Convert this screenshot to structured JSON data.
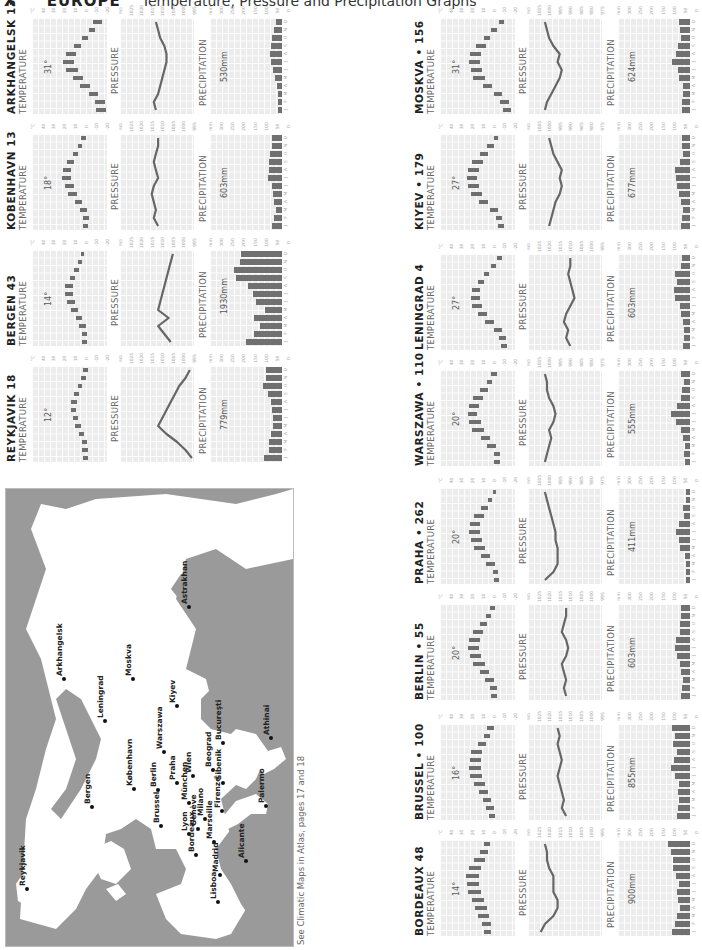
{
  "header": {
    "section": "X",
    "region": "EUROPE",
    "subtitle": "Temperature, Pressure and Precipitation Graphs"
  },
  "labels": {
    "temperature": "TEMPERATURE",
    "pressure": "PRESSURE",
    "precipitation": "PRECIPITATION",
    "months": [
      "J",
      "F",
      "M",
      "A",
      "M",
      "J",
      "J",
      "A",
      "S",
      "O",
      "N",
      "D"
    ],
    "temp_ticks": [
      "°C",
      "40",
      "30",
      "20",
      "10",
      "0",
      "-10",
      "-20"
    ],
    "precip_ticks": [
      "mm",
      "300",
      "250",
      "200",
      "150",
      "100",
      "50",
      "0"
    ]
  },
  "caption": "See Climatic Maps in Atlas, pages 17 and 18",
  "colors": {
    "bar": "#6e6e6e",
    "grid_bg": "#ececec",
    "land": "#9a9a9a",
    "sea": "#ffffff"
  },
  "chart_data": [
    {
      "type": "bar",
      "city": "ARKHANGELSK",
      "elev": "13",
      "sep": "",
      "temp_range_label": "31°",
      "precip_total": "530mm",
      "pressure_ticks": [
        "mb",
        "1025",
        "1020",
        "1015",
        "1010",
        "1005",
        "1000",
        "995"
      ],
      "temp_min": [
        -19,
        -18,
        -12,
        -4,
        2,
        7,
        11,
        9,
        4,
        -2,
        -9,
        -15
      ],
      "temp_max": [
        -10,
        -9,
        -3,
        5,
        12,
        18,
        21,
        18,
        11,
        3,
        -3,
        -7
      ],
      "pressure": [
        1013,
        1014,
        1012,
        1011,
        1010,
        1009,
        1008,
        1008,
        1009,
        1011,
        1012,
        1013
      ],
      "precip": [
        22,
        20,
        22,
        25,
        34,
        45,
        54,
        58,
        56,
        50,
        38,
        30
      ]
    },
    {
      "type": "bar",
      "city": "KOBENHAVN",
      "elev": "13",
      "sep": "",
      "temp_range_label": "18°",
      "precip_total": "603mm",
      "pressure_ticks": [
        "mb",
        "1025",
        "1020",
        "1015",
        "1010",
        "1005",
        "1000",
        "995"
      ],
      "temp_min": [
        -2,
        -3,
        -1,
        3,
        8,
        11,
        14,
        14,
        11,
        7,
        3,
        0
      ],
      "temp_max": [
        2,
        2,
        5,
        10,
        16,
        19,
        22,
        21,
        17,
        12,
        7,
        4
      ],
      "pressure": [
        1012,
        1014,
        1013,
        1014,
        1015,
        1014,
        1012,
        1013,
        1014,
        1013,
        1012,
        1012
      ],
      "precip": [
        49,
        39,
        32,
        38,
        43,
        47,
        71,
        66,
        62,
        59,
        48,
        49
      ]
    },
    {
      "type": "bar",
      "city": "BERGEN",
      "elev": "43",
      "sep": "",
      "temp_range_label": "14°",
      "precip_total": "1930mm",
      "pressure_ticks": [
        "mb",
        "1025",
        "1020",
        "1015",
        "1010",
        "1005",
        "1000",
        "995"
      ],
      "temp_min": [
        -1,
        -1,
        0,
        3,
        7,
        10,
        12,
        12,
        10,
        6,
        3,
        1
      ],
      "temp_max": [
        3,
        3,
        6,
        9,
        14,
        17,
        19,
        19,
        15,
        11,
        7,
        4
      ],
      "pressure": [
        1006,
        1009,
        1012,
        1007,
        1012,
        1011,
        1010,
        1009,
        1008,
        1007,
        1006,
        1005
      ],
      "precip": [
        179,
        139,
        109,
        140,
        83,
        126,
        141,
        167,
        228,
        236,
        207,
        203
      ]
    },
    {
      "type": "bar",
      "city": "REYKJAVIK",
      "elev": "18",
      "sep": "",
      "temp_range_label": "12°",
      "precip_total": "779mm",
      "pressure_ticks": [
        "mb",
        "1025",
        "1020",
        "1015",
        "1010",
        "1005",
        "1000",
        "995"
      ],
      "temp_min": [
        -2,
        -2,
        -1,
        1,
        4,
        7,
        9,
        8,
        6,
        3,
        0,
        -2
      ],
      "temp_max": [
        2,
        3,
        3,
        6,
        10,
        12,
        14,
        14,
        11,
        7,
        4,
        2
      ],
      "pressure": [
        996,
        999,
        1003,
        1008,
        1012,
        1010,
        1008,
        1006,
        1004,
        1002,
        999,
        997
      ],
      "precip": [
        89,
        64,
        62,
        56,
        42,
        42,
        50,
        56,
        67,
        94,
        78,
        79
      ]
    },
    {
      "type": "bar",
      "city": "MOSKVA",
      "elev": "156",
      "sep": "•",
      "temp_range_label": "31°",
      "precip_total": "624mm",
      "pressure_ticks": [
        "mb",
        "1005",
        "1000",
        "995",
        "990",
        "985",
        "980",
        "975"
      ],
      "temp_min": [
        -16,
        -14,
        -8,
        1,
        8,
        11,
        13,
        12,
        7,
        3,
        -3,
        -10
      ],
      "temp_max": [
        -9,
        -6,
        0,
        10,
        19,
        21,
        23,
        22,
        16,
        9,
        2,
        -5
      ],
      "pressure": [
        1002,
        1001,
        999,
        997,
        995,
        994,
        996,
        995,
        998,
        1000,
        1001,
        1002
      ],
      "precip": [
        39,
        38,
        36,
        37,
        53,
        58,
        88,
        71,
        58,
        45,
        47,
        54
      ]
    },
    {
      "type": "bar",
      "city": "KIYEV",
      "elev": "179",
      "sep": "•",
      "temp_range_label": "27°",
      "precip_total": "677mm",
      "pressure_ticks": [
        "mb",
        "1005",
        "1000",
        "995",
        "990",
        "985",
        "980",
        "975"
      ],
      "temp_min": [
        -10,
        -8,
        -4,
        5,
        11,
        14,
        15,
        14,
        10,
        5,
        0,
        -4
      ],
      "temp_max": [
        -4,
        -2,
        3,
        14,
        21,
        24,
        25,
        24,
        20,
        13,
        6,
        0
      ],
      "pressure": [
        1000,
        999,
        998,
        997,
        995,
        994,
        995,
        994,
        996,
        998,
        999,
        1000
      ],
      "precip": [
        43,
        39,
        35,
        46,
        56,
        66,
        70,
        72,
        47,
        35,
        41,
        41
      ]
    },
    {
      "type": "bar",
      "city": "LENINGRAD",
      "elev": "4",
      "sep": "",
      "temp_range_label": "27°",
      "precip_total": "603mm",
      "pressure_ticks": [
        "mb",
        "1025",
        "1020",
        "1015",
        "1010",
        "1005",
        "1000",
        "995"
      ],
      "temp_min": [
        -13,
        -12,
        -8,
        0,
        6,
        11,
        13,
        13,
        9,
        4,
        -2,
        -8
      ],
      "temp_max": [
        -7,
        -5,
        0,
        8,
        15,
        20,
        21,
        20,
        15,
        9,
        2,
        -3
      ],
      "pressure": [
        1010,
        1012,
        1011,
        1013,
        1012,
        1010,
        1008,
        1009,
        1010,
        1011,
        1010,
        1010
      ],
      "precip": [
        35,
        30,
        31,
        36,
        45,
        50,
        72,
        78,
        64,
        76,
        46,
        40
      ]
    },
    {
      "type": "bar",
      "city": "WARSZAWA",
      "elev": "110",
      "sep": "•",
      "temp_range_label": "20°",
      "precip_total": "555mm",
      "pressure_ticks": [
        "mb",
        "1005",
        "1000",
        "995",
        "990",
        "985",
        "980",
        "975"
      ],
      "temp_min": [
        -6,
        -6,
        -2,
        3,
        9,
        12,
        15,
        14,
        10,
        5,
        1,
        -3
      ],
      "temp_max": [
        0,
        0,
        6,
        12,
        20,
        23,
        24,
        23,
        19,
        13,
        6,
        2
      ],
      "pressure": [
        1002,
        1001,
        1000,
        999,
        1000,
        998,
        997,
        998,
        1000,
        1001,
        1001,
        1002
      ],
      "precip": [
        27,
        32,
        27,
        37,
        46,
        69,
        96,
        65,
        43,
        38,
        31,
        44
      ]
    },
    {
      "type": "bar",
      "city": "PRAHA",
      "elev": "262",
      "sep": "•",
      "temp_range_label": "20°",
      "precip_total": "411mm",
      "pressure_ticks": [
        "mb",
        "1005",
        "1000",
        "995",
        "990",
        "985",
        "980",
        "975"
      ],
      "temp_min": [
        -5,
        -4,
        -1,
        3,
        8,
        11,
        13,
        13,
        9,
        5,
        1,
        -2
      ],
      "temp_max": [
        0,
        1,
        7,
        12,
        18,
        21,
        23,
        22,
        18,
        12,
        5,
        1
      ],
      "pressure": [
        1002,
        998,
        996,
        996,
        996,
        997,
        997,
        998,
        999,
        1000,
        1001,
        1002
      ],
      "precip": [
        18,
        18,
        18,
        27,
        48,
        54,
        68,
        55,
        31,
        33,
        20,
        21
      ]
    },
    {
      "type": "bar",
      "city": "BERLIN",
      "elev": "55",
      "sep": "•",
      "temp_range_label": "20°",
      "precip_total": "603mm",
      "pressure_ticks": [
        "mb",
        "1025",
        "1020",
        "1015",
        "1010",
        "1005",
        "1000",
        "995"
      ],
      "temp_min": [
        -3,
        -3,
        0,
        4,
        8,
        12,
        14,
        13,
        10,
        6,
        2,
        -1
      ],
      "temp_max": [
        2,
        3,
        8,
        13,
        19,
        22,
        24,
        23,
        19,
        13,
        7,
        3
      ],
      "pressure": [
        1012,
        1013,
        1012,
        1013,
        1014,
        1012,
        1011,
        1012,
        1014,
        1013,
        1012,
        1012
      ],
      "precip": [
        46,
        40,
        33,
        42,
        49,
        65,
        73,
        69,
        48,
        49,
        46,
        43
      ]
    },
    {
      "type": "bar",
      "city": "BRUSSEL",
      "elev": "100",
      "sep": "•",
      "temp_range_label": "16°",
      "precip_total": "855mm",
      "pressure_ticks": [
        "mb",
        "1025",
        "1020",
        "1015",
        "1010",
        "1005",
        "1000",
        "995"
      ],
      "temp_min": [
        -1,
        0,
        2,
        5,
        8,
        11,
        12,
        12,
        11,
        7,
        3,
        0
      ],
      "temp_max": [
        4,
        7,
        10,
        14,
        18,
        22,
        23,
        22,
        21,
        15,
        9,
        6
      ],
      "pressure": [
        1012,
        1014,
        1013,
        1014,
        1015,
        1016,
        1015,
        1014,
        1015,
        1016,
        1015,
        1016
      ],
      "precip": [
        66,
        61,
        53,
        60,
        55,
        76,
        95,
        80,
        63,
        83,
        75,
        88
      ]
    },
    {
      "type": "bar",
      "city": "BORDEAUX",
      "elev": "48",
      "sep": "",
      "temp_range_label": "14°",
      "precip_total": "900mm",
      "pressure_ticks": [
        "mb",
        "1025",
        "1020",
        "1015",
        "1010",
        "1005",
        "1000",
        "995"
      ],
      "temp_min": [
        2,
        2,
        4,
        6,
        9,
        12,
        14,
        14,
        12,
        8,
        5,
        3
      ],
      "temp_max": [
        9,
        11,
        15,
        17,
        20,
        24,
        25,
        26,
        23,
        18,
        13,
        9
      ],
      "pressure": [
        1024,
        1022,
        1018,
        1016,
        1016,
        1018,
        1018,
        1018,
        1020,
        1021,
        1021,
        1022
      ],
      "precip": [
        90,
        75,
        63,
        48,
        61,
        65,
        56,
        70,
        84,
        83,
        96,
        109
      ]
    }
  ],
  "layout": {
    "left_panels": [
      0,
      1,
      2,
      3
    ],
    "right_panels": [
      4,
      5,
      6,
      7,
      8,
      9,
      10,
      11
    ]
  },
  "map": {
    "cities": [
      {
        "name": "Reykjavik",
        "x": 21,
        "y": 400
      },
      {
        "name": "Bergen",
        "x": 86,
        "y": 318
      },
      {
        "name": "Arkhangelsk",
        "x": 58,
        "y": 190
      },
      {
        "name": "Leningrad",
        "x": 99,
        "y": 232
      },
      {
        "name": "Moskva",
        "x": 127,
        "y": 190
      },
      {
        "name": "København",
        "x": 128,
        "y": 300
      },
      {
        "name": "Berlin",
        "x": 152,
        "y": 301
      },
      {
        "name": "Warszawa",
        "x": 158,
        "y": 263
      },
      {
        "name": "Kiyev",
        "x": 171,
        "y": 217
      },
      {
        "name": "Brussel",
        "x": 155,
        "y": 337
      },
      {
        "name": "Praha",
        "x": 171,
        "y": 294
      },
      {
        "name": "Wien",
        "x": 187,
        "y": 287
      },
      {
        "name": "München",
        "x": 183,
        "y": 314
      },
      {
        "name": "Lyon",
        "x": 183,
        "y": 345
      },
      {
        "name": "Genève",
        "x": 192,
        "y": 340
      },
      {
        "name": "Milano",
        "x": 199,
        "y": 330
      },
      {
        "name": "Bordeaux",
        "x": 190,
        "y": 366
      },
      {
        "name": "Marseille",
        "x": 208,
        "y": 353
      },
      {
        "name": "Firenze",
        "x": 216,
        "y": 322
      },
      {
        "name": "Beograd",
        "x": 207,
        "y": 281
      },
      {
        "name": "Šibenik",
        "x": 217,
        "y": 294
      },
      {
        "name": "Bucureşti",
        "x": 217,
        "y": 254
      },
      {
        "name": "Astrakhan",
        "x": 183,
        "y": 118
      },
      {
        "name": "Madrid",
        "x": 214,
        "y": 386
      },
      {
        "name": "Lisboa",
        "x": 212,
        "y": 413
      },
      {
        "name": "Alicante",
        "x": 240,
        "y": 372
      },
      {
        "name": "Palermo",
        "x": 260,
        "y": 317
      },
      {
        "name": "Athinai",
        "x": 265,
        "y": 249
      }
    ]
  }
}
